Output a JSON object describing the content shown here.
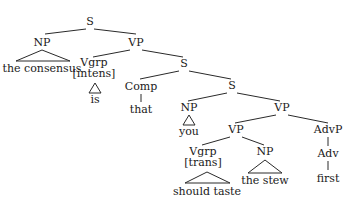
{
  "diagram": {
    "type": "syntax-tree",
    "sentence": "the consensus is that you should taste the stew first",
    "nodes": {
      "s_root": "S",
      "np_subject": "NP",
      "np_subject_text": "the consensus",
      "vp_main": "VP",
      "vgrp_intens_1": "Vgrp",
      "vgrp_intens_2": "[intens]",
      "vgrp_intens_text": "is",
      "s_clause": "S",
      "comp": "Comp",
      "comp_text": "that",
      "s_inner": "S",
      "np_you": "NP",
      "np_you_text": "you",
      "vp_outer": "VP",
      "vp_inner": "VP",
      "advp": "AdvP",
      "adv": "Adv",
      "adv_text": "first",
      "vgrp_trans_1": "Vgrp",
      "vgrp_trans_2": "[trans]",
      "vgrp_trans_text": "should taste",
      "np_object": "NP",
      "np_object_text": "the stew"
    }
  }
}
